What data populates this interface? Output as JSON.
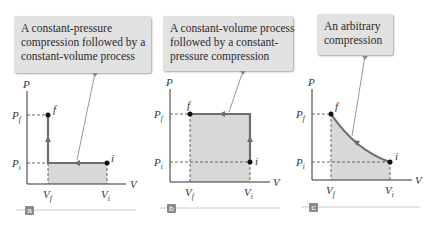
{
  "colors": {
    "path": "#6e6e6e",
    "fill": "#d8d8d8",
    "callout_bg": "#e2e2e2",
    "badge_bg": "#8a8a8a",
    "rule": "#bdbdbd"
  },
  "panels": [
    {
      "id": "a",
      "badge": "a",
      "callout": [
        "A constant-pressure",
        "compression followed by a",
        "constant-volume process"
      ],
      "labels": {
        "P": "P",
        "V": "V",
        "Pf": "P",
        "Pf_sub": "f",
        "Pi": "P",
        "Pi_sub": "i",
        "Vf": "V",
        "Vf_sub": "f",
        "Vi": "V",
        "Vi_sub": "i",
        "f": "f",
        "i": "i"
      }
    },
    {
      "id": "b",
      "badge": "b",
      "callout": [
        "A constant-volume process",
        "followed by a constant-",
        "pressure compression"
      ],
      "labels": {
        "P": "P",
        "V": "V",
        "Pf": "P",
        "Pf_sub": "f",
        "Pi": "P",
        "Pi_sub": "i",
        "Vf": "V",
        "Vf_sub": "f",
        "Vi": "V",
        "Vi_sub": "i",
        "f": "f",
        "i": "i"
      }
    },
    {
      "id": "c",
      "badge": "c",
      "callout": [
        "An arbitrary",
        "compression"
      ],
      "labels": {
        "P": "P",
        "V": "V",
        "Pf": "P",
        "Pf_sub": "f",
        "Pi": "P",
        "Pi_sub": "i",
        "Vf": "V",
        "Vf_sub": "f",
        "Vi": "V",
        "Vi_sub": "i",
        "f": "f",
        "i": "i"
      }
    }
  ]
}
